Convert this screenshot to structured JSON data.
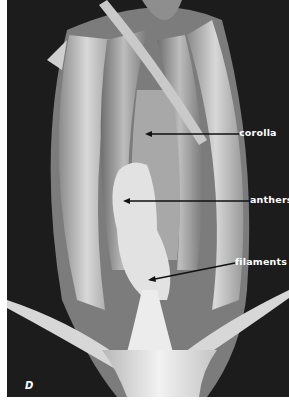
{
  "figure": {
    "panel_letter": "D",
    "labels": [
      {
        "text": "corolla",
        "target": "corolla"
      },
      {
        "text": "anthers",
        "target": "anthers"
      },
      {
        "text": "filaments",
        "target": "filaments"
      }
    ],
    "colors": {
      "background": "#1c1c1c",
      "label_text": "#ffffff",
      "leader_line": "#111111",
      "margin": "#ffffff"
    }
  }
}
